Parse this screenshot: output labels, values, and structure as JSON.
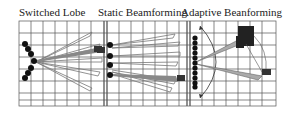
{
  "panels": [
    {
      "title": "Switched Lobe",
      "x": 19
    },
    {
      "title": "Static Beamforming",
      "x": 98
    },
    {
      "title": "Adaptive Beanforming",
      "x": 181
    }
  ],
  "colors": {
    "grid": "#444444",
    "element": "#111111",
    "lobe_outline": "#777777",
    "beam_fill": "#aaaaaa",
    "target": "#333333"
  }
}
